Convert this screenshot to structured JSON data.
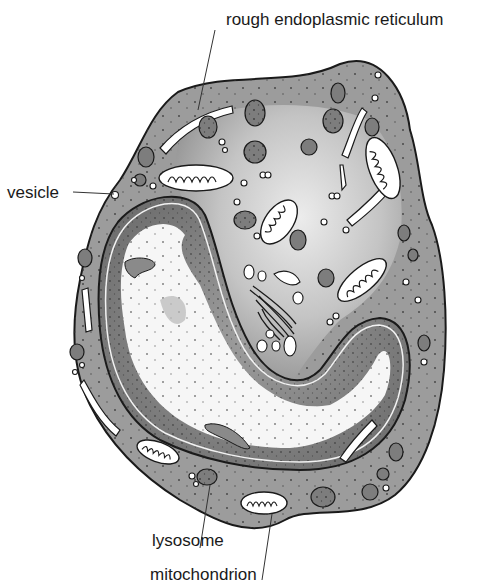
{
  "figure": {
    "type": "cell cross-section diagram",
    "colors": {
      "background": "#ffffff",
      "cytoplasm": "#9a9a9a",
      "cytoplasm_light": "#d8d8d8",
      "nucleus_dark": "#7a7a7a",
      "nucleus_light": "#f4f4f4",
      "outline": "#1a1a1a",
      "organelle_white": "#ffffff"
    }
  },
  "labels": {
    "rough_er": "rough endoplasmic reticulum",
    "vesicle": "vesicle",
    "lysosome": "lysosome",
    "mitochondrion": "mitochondrion"
  }
}
